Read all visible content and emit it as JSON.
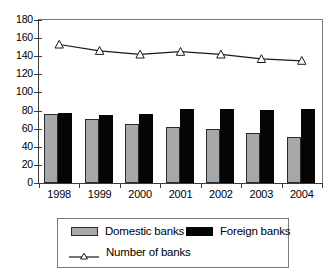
{
  "chart_data": {
    "type": "bar",
    "title": "",
    "subtitle": "",
    "xlabel": "",
    "ylabel": "",
    "categories": [
      "1998",
      "1999",
      "2000",
      "2001",
      "2002",
      "2003",
      "2004"
    ],
    "ylim": [
      0,
      180
    ],
    "y_ticks": [
      0,
      20,
      40,
      60,
      80,
      100,
      120,
      140,
      160,
      180
    ],
    "y_tick_labels": [
      "0",
      "20",
      "40",
      "60",
      "80",
      "100",
      "120",
      "140",
      "160",
      "180"
    ],
    "grid": false,
    "legend_position": "bottom",
    "series": [
      {
        "name": "Domestic banks",
        "type": "bar",
        "color": "#a8a8a8",
        "values": [
          76,
          71,
          65,
          62,
          60,
          55,
          51
        ]
      },
      {
        "name": "Foreign banks",
        "type": "bar",
        "color": "#050505",
        "values": [
          77,
          75,
          76,
          82,
          82,
          81,
          82
        ]
      },
      {
        "name": "Number of banks",
        "type": "line",
        "color": "#1a1a1a",
        "marker": "triangle",
        "values": [
          153,
          146,
          142,
          145,
          142,
          137,
          135
        ]
      }
    ]
  },
  "legend": {
    "items": [
      {
        "label": "Domestic banks",
        "marker": "gray-square-swatch"
      },
      {
        "label": "Foreign banks",
        "marker": "black-square-swatch"
      },
      {
        "label": "Number of banks",
        "marker": "line-triangle-swatch"
      }
    ]
  }
}
